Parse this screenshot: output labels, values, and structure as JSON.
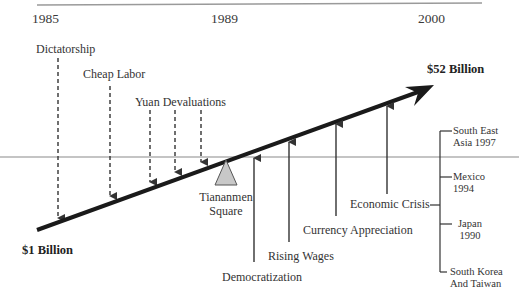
{
  "years": {
    "start": "1985",
    "mid": "1989",
    "end": "2000"
  },
  "values": {
    "start": "$1 Billion",
    "end": "$52 Billion"
  },
  "fulcrum": {
    "label_line1": "Tiananmen",
    "label_line2": "Square"
  },
  "push_down_factors": [
    {
      "label": "Dictatorship"
    },
    {
      "label": "Cheap Labor"
    },
    {
      "label": "Yuan Devaluations"
    }
  ],
  "push_up_factors": [
    {
      "label": "Democratization"
    },
    {
      "label": "Rising Wages"
    },
    {
      "label": "Currency Appreciation"
    },
    {
      "label": "Economic Crisis"
    }
  ],
  "crises": [
    {
      "line1": "South East",
      "line2": "Asia 1997"
    },
    {
      "line1": "Mexico",
      "line2": "1994"
    },
    {
      "line1": "Japan",
      "line2": "1990"
    },
    {
      "line1": "South Korea",
      "line2": "And Taiwan"
    }
  ],
  "colors": {
    "arrow": "#1a1a1a",
    "fulcrum": "#c8c8c8",
    "rule": "#9a9a9a"
  }
}
